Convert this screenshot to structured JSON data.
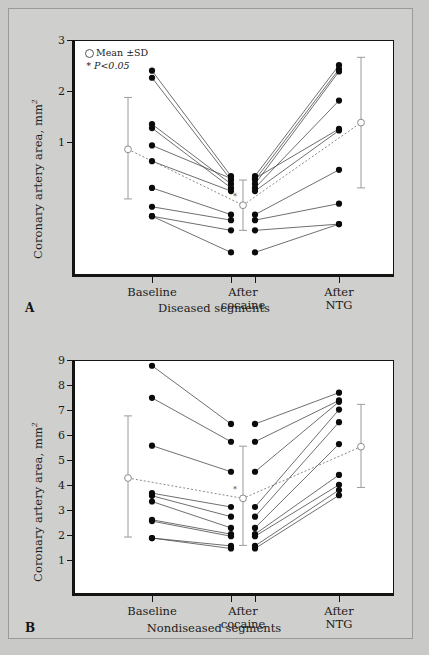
{
  "figure": {
    "background_color": "#c9c9c7",
    "panel_bg": "#ffffff"
  },
  "panels": [
    {
      "letter": "A",
      "caption": "Diseased segments",
      "ylabel_text": "Coronary artery area, mm",
      "ylabel_sup": "2",
      "legend": {
        "mean_label": "Mean  ±SD",
        "p_label": "P<0.05",
        "star": "*"
      },
      "categories": [
        "Baseline",
        "After\ncocaine",
        "After\nNTG"
      ],
      "yticks": [
        1,
        2,
        3
      ],
      "ylim": [
        0.0,
        3.0
      ]
    },
    {
      "letter": "B",
      "caption": "Nondiseased segments",
      "ylabel_text": "Coronary artery area, mm",
      "ylabel_sup": "2",
      "legend": null,
      "categories": [
        "Baseline",
        "After\ncocaine",
        "After\nNTG"
      ],
      "yticks": [
        1,
        2,
        3,
        4,
        5,
        6,
        7,
        8,
        9
      ],
      "ylim": [
        0.0,
        9.0
      ]
    }
  ],
  "chart_data": [
    {
      "type": "line",
      "id": "panel-a",
      "title": "Diseased segments",
      "ylabel": "Coronary artery area, mm^2",
      "xlabel": "",
      "categories": [
        "Baseline",
        "After cocaine",
        "After NTG"
      ],
      "ylim": [
        0.0,
        3.0
      ],
      "yticks": [
        1,
        2,
        3
      ],
      "grid": false,
      "legend": [
        "Mean ±SD",
        "* P<0.05"
      ],
      "annotations": [
        "* P<0.05 at After cocaine"
      ],
      "series": [
        {
          "name": "subject-1",
          "values": [
            2.61,
            1.27,
            2.68
          ]
        },
        {
          "name": "subject-2",
          "values": [
            2.52,
            1.22,
            2.63
          ]
        },
        {
          "name": "subject-3",
          "values": [
            1.93,
            1.17,
            2.6
          ]
        },
        {
          "name": "subject-4",
          "values": [
            1.88,
            1.12,
            2.23
          ]
        },
        {
          "name": "subject-5",
          "values": [
            1.66,
            1.24,
            1.87
          ]
        },
        {
          "name": "subject-6",
          "values": [
            1.46,
            1.08,
            1.85
          ]
        },
        {
          "name": "subject-7",
          "values": [
            1.12,
            0.78,
            1.35
          ]
        },
        {
          "name": "subject-8",
          "values": [
            0.88,
            0.71,
            0.92
          ]
        },
        {
          "name": "subject-9",
          "values": [
            0.76,
            0.58,
            0.66
          ]
        },
        {
          "name": "subject-10",
          "values": [
            0.76,
            0.3,
            0.66
          ]
        }
      ],
      "mean": {
        "name": "Mean ±SD",
        "values": [
          1.61,
          0.9,
          1.95
        ],
        "sd_upper": [
          2.27,
          1.22,
          2.78
        ],
        "sd_lower": [
          0.98,
          0.58,
          1.12
        ]
      }
    },
    {
      "type": "line",
      "id": "panel-b",
      "title": "Nondiseased segments",
      "ylabel": "Coronary artery area, mm^2",
      "xlabel": "",
      "categories": [
        "Baseline",
        "After cocaine",
        "After NTG"
      ],
      "ylim": [
        0.0,
        9.0
      ],
      "yticks": [
        1,
        2,
        3,
        4,
        5,
        6,
        7,
        8,
        9
      ],
      "grid": false,
      "legend": [],
      "annotations": [
        "* P<0.05 at After cocaine"
      ],
      "series": [
        {
          "name": "subject-1",
          "values": [
            8.78,
            6.55,
            7.75
          ]
        },
        {
          "name": "subject-2",
          "values": [
            7.55,
            5.87,
            7.45
          ]
        },
        {
          "name": "subject-3",
          "values": [
            5.72,
            4.72,
            7.4
          ]
        },
        {
          "name": "subject-4",
          "values": [
            3.9,
            3.37,
            7.1
          ]
        },
        {
          "name": "subject-5",
          "values": [
            3.8,
            3.0,
            6.62
          ]
        },
        {
          "name": "subject-6",
          "values": [
            3.58,
            2.57,
            5.78
          ]
        },
        {
          "name": "subject-7",
          "values": [
            2.88,
            2.33,
            4.6
          ]
        },
        {
          "name": "subject-8",
          "values": [
            2.83,
            2.25,
            4.22
          ]
        },
        {
          "name": "subject-9",
          "values": [
            2.18,
            1.88,
            4.02
          ]
        },
        {
          "name": "subject-10",
          "values": [
            2.18,
            1.78,
            3.82
          ]
        }
      ],
      "mean": {
        "name": "Mean ±SD",
        "values": [
          4.48,
          3.7,
          5.68
        ]
      },
      "mean_detail": {
        "sd_upper": [
          6.86,
          5.7,
          7.3
        ],
        "sd_lower": [
          2.22,
          1.9,
          4.12
        ]
      }
    }
  ]
}
